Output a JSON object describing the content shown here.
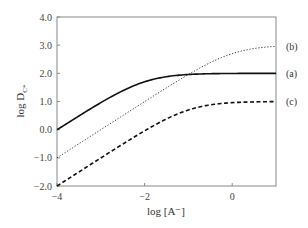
{
  "chart_data": {
    "type": "line",
    "title": "",
    "xlabel": "log [A⁻]",
    "ylabel": "log D",
    "ylabel_subscript": "C*",
    "xlim": [
      -4,
      1
    ],
    "ylim": [
      -2.0,
      4.0
    ],
    "xticks": [
      -4,
      -2,
      0
    ],
    "xtick_labels": [
      "−4",
      "−2",
      "0"
    ],
    "yticks": [
      -2.0,
      -1.0,
      0.0,
      1.0,
      2.0,
      3.0,
      4.0
    ],
    "ytick_labels": [
      "−2.0",
      "−1.0",
      "0.0",
      "1.0",
      "2.0",
      "3.0",
      "4.0"
    ],
    "grid": false,
    "legend_position": "right-inline",
    "x": [
      -4,
      -3.5,
      -3,
      -2.5,
      -2,
      -1.5,
      -1,
      -0.5,
      0,
      0.5,
      1
    ],
    "series": [
      {
        "name": "(a)",
        "style": "solid",
        "values": [
          0.0,
          0.49,
          0.96,
          1.38,
          1.7,
          1.88,
          1.96,
          1.99,
          2.0,
          2.0,
          2.0
        ]
      },
      {
        "name": "(b)",
        "style": "dotted",
        "values": [
          -1.0,
          -0.5,
          0.0,
          0.5,
          1.0,
          1.49,
          1.96,
          2.38,
          2.7,
          2.88,
          2.96
        ]
      },
      {
        "name": "(c)",
        "style": "dashed",
        "values": [
          -2.0,
          -1.5,
          -1.04,
          -0.54,
          -0.04,
          0.38,
          0.7,
          0.88,
          0.96,
          0.99,
          1.0
        ]
      }
    ]
  },
  "labels": {
    "xlabel": "log [A⁻]",
    "ylabel_main": "log D",
    "ylabel_sub": "C*",
    "series_a": "(a)",
    "series_b": "(b)",
    "series_c": "(c)"
  }
}
